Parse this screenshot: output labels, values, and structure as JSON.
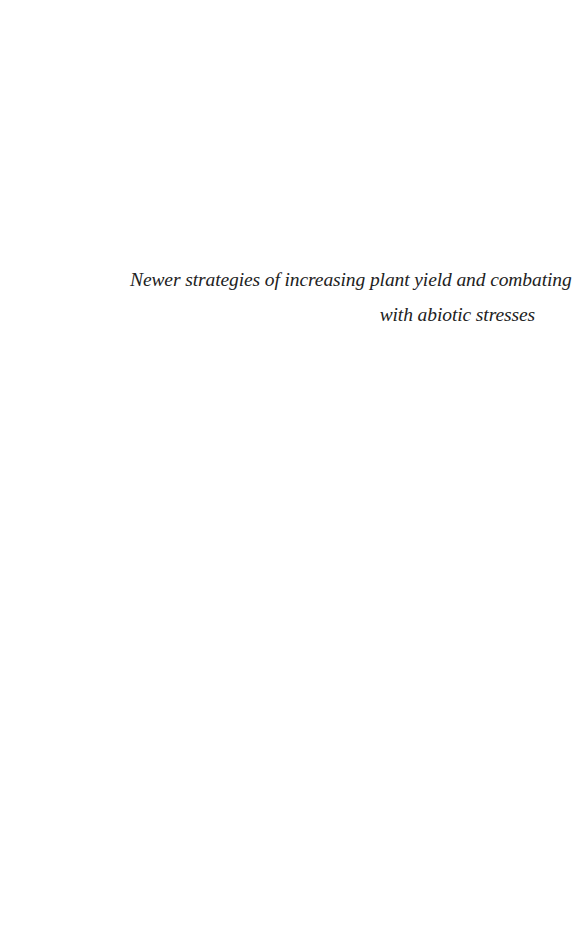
{
  "page": {
    "title_lines": [
      "Newer strategies of increasing plant yield and combating",
      "with abiotic stresses"
    ]
  }
}
